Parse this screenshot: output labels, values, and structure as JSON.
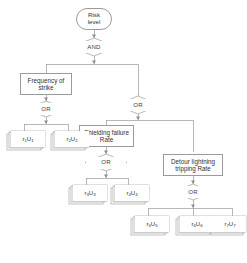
{
  "diagram": {
    "type": "fault-tree",
    "stroke_color": "#9a9a9a",
    "text_color": "#2f2f2f",
    "background": "#ffffff",
    "nodes": [
      {
        "id": "top",
        "kind": "top-event",
        "label": "Risk\nlevel",
        "line1": "Risk",
        "line2": "level"
      },
      {
        "id": "gate_and",
        "kind": "and-gate",
        "label": "AND"
      },
      {
        "id": "freq",
        "kind": "intermediate-event",
        "label": "Frequency of strike",
        "line1": "Frequency of",
        "line2": "strike"
      },
      {
        "id": "gate_or1",
        "kind": "or-gate",
        "label": "OR"
      },
      {
        "id": "gate_or2",
        "kind": "or-gate",
        "label": "OR"
      },
      {
        "id": "shield",
        "kind": "intermediate-event",
        "label": "Shielding failure Rate",
        "line1": "Shielding failure",
        "line2": "Rate"
      },
      {
        "id": "detour",
        "kind": "intermediate-event",
        "label": "Detour lightning tripping Rate",
        "line1": "Detour lightning",
        "line2": "tripping Rate"
      },
      {
        "id": "gate_or3",
        "kind": "or-gate",
        "label": "OR"
      },
      {
        "id": "gate_or4",
        "kind": "or-gate",
        "label": "OR"
      },
      {
        "id": "b1",
        "kind": "basic-event",
        "label": "r1U1",
        "base_r": "r",
        "sub_r": "1",
        "base_u": "U",
        "sub_u": "1"
      },
      {
        "id": "b2",
        "kind": "basic-event",
        "label": "r2U2",
        "base_r": "r",
        "sub_r": "2",
        "base_u": "U",
        "sub_u": "2"
      },
      {
        "id": "b3",
        "kind": "basic-event",
        "label": "r3U3",
        "base_r": "r",
        "sub_r": "3",
        "base_u": "U",
        "sub_u": "3"
      },
      {
        "id": "b4",
        "kind": "basic-event",
        "label": "r4U4",
        "base_r": "r",
        "sub_r": "4",
        "base_u": "U",
        "sub_u": "4"
      },
      {
        "id": "b5",
        "kind": "basic-event",
        "label": "r5U5",
        "base_r": "r",
        "sub_r": "5",
        "base_u": "U",
        "sub_u": "5"
      },
      {
        "id": "b6",
        "kind": "basic-event",
        "label": "r6U6",
        "base_r": "r",
        "sub_r": "6",
        "base_u": "U",
        "sub_u": "6"
      },
      {
        "id": "b7",
        "kind": "basic-event",
        "label": "r7U7",
        "base_r": "r",
        "sub_r": "7",
        "base_u": "U",
        "sub_u": "7"
      }
    ],
    "edges": [
      {
        "from": "top",
        "to": "gate_and"
      },
      {
        "from": "gate_and",
        "to": "freq"
      },
      {
        "from": "gate_and",
        "to": "gate_or2"
      },
      {
        "from": "freq",
        "to": "gate_or1"
      },
      {
        "from": "gate_or1",
        "to": "b1"
      },
      {
        "from": "gate_or1",
        "to": "b2"
      },
      {
        "from": "gate_or2",
        "to": "shield"
      },
      {
        "from": "gate_or2",
        "to": "detour"
      },
      {
        "from": "shield",
        "to": "gate_or3"
      },
      {
        "from": "gate_or3",
        "to": "b3"
      },
      {
        "from": "gate_or3",
        "to": "b4"
      },
      {
        "from": "detour",
        "to": "gate_or4"
      },
      {
        "from": "gate_or4",
        "to": "b5"
      },
      {
        "from": "gate_or4",
        "to": "b6"
      },
      {
        "from": "gate_or4",
        "to": "b7"
      }
    ]
  }
}
